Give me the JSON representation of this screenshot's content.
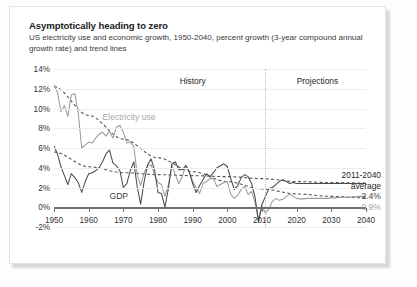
{
  "card": {
    "title": "Asymptotically heading to zero",
    "subtitle": "US electricity use and economic growth, 1950-2040, percent growth (3-year compound annual growth rate) and trend lines"
  },
  "annotations": {
    "history": "History",
    "projections": "Projections",
    "electricity_label": "Electricity use",
    "gdp_label": "GDP",
    "average_heading_line1": "2011-2040",
    "average_heading_line2": "average",
    "gdp_average": "2.4%",
    "electricity_average": "0.9%"
  },
  "colors": {
    "gdp_line": "#4a4a4a",
    "electricity_line": "#9a9a9a",
    "trend_dash": "#555555",
    "grid": "#ededed",
    "axis": "#6e6e6e",
    "divider": "#b9b9b9",
    "card_bg": "#ffffff"
  },
  "chart_data": {
    "type": "line",
    "title": "Asymptotically heading to zero",
    "subtitle": "US electricity use and economic growth, 1950-2040, percent growth (3-year compound annual growth rate) and trend lines",
    "xlabel": "",
    "ylabel": "",
    "xlim": [
      1950,
      2040
    ],
    "ylim": [
      -2,
      14
    ],
    "ytick_labels": [
      "14%",
      "12%",
      "10%",
      "8%",
      "6%",
      "4%",
      "2%",
      "0%",
      "-2%"
    ],
    "ytick_values": [
      14,
      12,
      10,
      8,
      6,
      4,
      2,
      0,
      -2
    ],
    "xtick_labels": [
      "1950",
      "1960",
      "1970",
      "1980",
      "1990",
      "2000",
      "2010",
      "2020",
      "2030",
      "2040"
    ],
    "xtick_values": [
      1950,
      1960,
      1970,
      1980,
      1990,
      2000,
      2010,
      2020,
      2030,
      2040
    ],
    "grid": true,
    "legend": "inline-labels",
    "history_projection_split": 2011,
    "series": [
      {
        "name": "Electricity use",
        "color": "#9a9a9a",
        "style": "solid",
        "x": [
          1950,
          1951,
          1952,
          1953,
          1954,
          1955,
          1956,
          1957,
          1958,
          1959,
          1960,
          1961,
          1962,
          1963,
          1964,
          1965,
          1966,
          1967,
          1968,
          1969,
          1970,
          1971,
          1972,
          1973,
          1974,
          1975,
          1976,
          1977,
          1978,
          1979,
          1980,
          1981,
          1982,
          1983,
          1984,
          1985,
          1986,
          1987,
          1988,
          1989,
          1990,
          1991,
          1992,
          1993,
          1994,
          1995,
          1996,
          1997,
          1998,
          1999,
          2000,
          2001,
          2002,
          2003,
          2004,
          2005,
          2006,
          2007,
          2008,
          2009,
          2010,
          2011,
          2012,
          2013,
          2014,
          2015,
          2016,
          2017,
          2018,
          2019,
          2020,
          2021,
          2022,
          2023,
          2024,
          2025,
          2026,
          2027,
          2028,
          2029,
          2030,
          2031,
          2032,
          2033,
          2034,
          2035,
          2036,
          2037,
          2038,
          2039,
          2040
        ],
        "values": [
          12.4,
          11.6,
          9.7,
          10.3,
          9.2,
          11.4,
          11.5,
          9.5,
          6.0,
          6.3,
          6.6,
          6.5,
          7.0,
          7.4,
          7.6,
          7.2,
          7.7,
          7.0,
          8.1,
          8.3,
          7.6,
          6.5,
          6.6,
          6.2,
          3.3,
          2.2,
          3.5,
          4.2,
          4.3,
          3.3,
          2.5,
          2.3,
          1.1,
          2.3,
          4.3,
          3.3,
          2.4,
          3.1,
          4.3,
          3.6,
          2.6,
          2.0,
          1.4,
          2.4,
          2.6,
          2.9,
          2.9,
          2.1,
          2.3,
          2.5,
          2.6,
          1.3,
          0.9,
          1.2,
          1.8,
          2.1,
          1.3,
          1.6,
          0.5,
          -1.2,
          0.1,
          -0.6,
          -0.2,
          0.6,
          0.9,
          0.7,
          0.8,
          1.1,
          1.3,
          1.1,
          0.9,
          0.85,
          0.85,
          0.9,
          0.9,
          0.9,
          0.9,
          0.9,
          0.9,
          0.9,
          0.95,
          0.95,
          1.0,
          1.0,
          1.0,
          1.0,
          1.05,
          1.05,
          1.1,
          1.1,
          1.1
        ]
      },
      {
        "name": "GDP",
        "color": "#4a4a4a",
        "style": "solid",
        "x": [
          1950,
          1951,
          1952,
          1953,
          1954,
          1955,
          1956,
          1957,
          1958,
          1959,
          1960,
          1961,
          1962,
          1963,
          1964,
          1965,
          1966,
          1967,
          1968,
          1969,
          1970,
          1971,
          1972,
          1973,
          1974,
          1975,
          1976,
          1977,
          1978,
          1979,
          1980,
          1981,
          1982,
          1983,
          1984,
          1985,
          1986,
          1987,
          1988,
          1989,
          1990,
          1991,
          1992,
          1993,
          1994,
          1995,
          1996,
          1997,
          1998,
          1999,
          2000,
          2001,
          2002,
          2003,
          2004,
          2005,
          2006,
          2007,
          2008,
          2009,
          2010,
          2011,
          2012,
          2013,
          2014,
          2015,
          2016,
          2017,
          2018,
          2019,
          2020,
          2021,
          2022,
          2023,
          2024,
          2025,
          2026,
          2027,
          2028,
          2029,
          2030,
          2031,
          2032,
          2033,
          2034,
          2035,
          2036,
          2037,
          2038,
          2039,
          2040
        ],
        "values": [
          6.2,
          5.4,
          4.1,
          3.2,
          2.3,
          3.4,
          3.0,
          2.5,
          1.5,
          2.6,
          3.4,
          3.5,
          3.7,
          4.0,
          4.6,
          5.4,
          5.8,
          4.5,
          4.2,
          3.7,
          2.0,
          2.4,
          3.7,
          4.6,
          2.1,
          0.3,
          2.6,
          4.3,
          4.9,
          3.8,
          1.5,
          1.4,
          0.0,
          1.9,
          4.4,
          4.6,
          3.8,
          3.8,
          4.2,
          3.6,
          2.4,
          1.5,
          2.2,
          2.8,
          3.4,
          3.1,
          3.5,
          4.0,
          4.2,
          4.4,
          4.1,
          2.9,
          1.8,
          2.2,
          3.0,
          3.3,
          3.1,
          2.4,
          1.0,
          -1.5,
          0.3,
          1.1,
          1.9,
          2.0,
          2.3,
          2.6,
          2.8,
          2.6,
          2.4,
          2.5,
          2.4,
          2.4,
          2.4,
          2.4,
          2.4,
          2.4,
          2.4,
          2.4,
          2.4,
          2.4,
          2.4,
          2.4,
          2.4,
          2.4,
          2.4,
          2.4,
          2.4,
          2.4,
          2.4,
          2.4,
          2.4
        ]
      }
    ],
    "trend_lines": [
      {
        "name": "Electricity use trend",
        "style": "dashed",
        "color": "#555555",
        "x": [
          1950,
          1960,
          1970,
          1980,
          1990,
          2000,
          2010,
          2020,
          2030,
          2040
        ],
        "values": [
          12.2,
          9.3,
          6.9,
          5.0,
          3.6,
          2.6,
          1.85,
          1.35,
          1.1,
          0.95
        ]
      },
      {
        "name": "GDP trend",
        "style": "dashed",
        "color": "#555555",
        "x": [
          1950,
          1960,
          1970,
          1980,
          1990,
          2000,
          2010,
          2020,
          2030,
          2040
        ],
        "values": [
          5.6,
          4.1,
          3.5,
          3.3,
          3.2,
          3.1,
          2.9,
          2.6,
          2.5,
          2.45
        ]
      }
    ],
    "annotations": [
      {
        "text": "History",
        "x": 1990,
        "y": 13.4
      },
      {
        "text": "Projections",
        "x": 2026,
        "y": 13.4
      },
      {
        "text": "Electricity use",
        "x": 1966,
        "y": 9.1
      },
      {
        "text": "GDP",
        "x": 1967,
        "y": 0.9
      },
      {
        "text": "2011-2040 average",
        "x": 2045,
        "y": 5.0
      },
      {
        "text": "2.4%",
        "x": 2045,
        "y": 2.8
      },
      {
        "text": "0.9%",
        "x": 2045,
        "y": 1.0
      }
    ]
  }
}
